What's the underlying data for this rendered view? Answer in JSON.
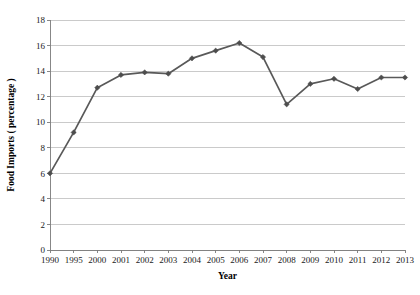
{
  "chart_data": {
    "type": "line",
    "title": "",
    "xlabel": "Year",
    "ylabel": "Food Imports ( percentage )",
    "categories": [
      "1990",
      "1995",
      "2000",
      "2001",
      "2002",
      "2003",
      "2004",
      "2005",
      "2006",
      "2007",
      "2008",
      "2009",
      "2010",
      "2011",
      "2012",
      "2013"
    ],
    "values": [
      6.0,
      9.2,
      12.7,
      13.7,
      13.9,
      13.8,
      15.0,
      15.6,
      16.2,
      15.1,
      11.4,
      13.0,
      13.4,
      12.6,
      13.5,
      13.5
    ],
    "series": [
      {
        "name": "Food Imports ( percentage )",
        "values": [
          6.0,
          9.2,
          12.7,
          13.7,
          13.9,
          13.8,
          15.0,
          15.6,
          16.2,
          15.1,
          11.4,
          13.0,
          13.4,
          12.6,
          13.5,
          13.5
        ]
      }
    ],
    "ylim": [
      0,
      18
    ],
    "ytick_step": 2,
    "yticks": [
      "0",
      "2",
      "4",
      "6",
      "8",
      "10",
      "12",
      "14",
      "16",
      "18"
    ],
    "grid": true,
    "grid_axis": "y",
    "legend": false,
    "legend_position": "none",
    "marker": "diamond",
    "line_color": "#595959",
    "marker_color": "#4d4d4d",
    "grid_color": "#b4b4b4",
    "axis_color": "#7a7a7a",
    "background_color": "#ffffff",
    "plot_geometry": {
      "left": 50,
      "right": 405,
      "top": 20,
      "bottom": 250
    }
  }
}
